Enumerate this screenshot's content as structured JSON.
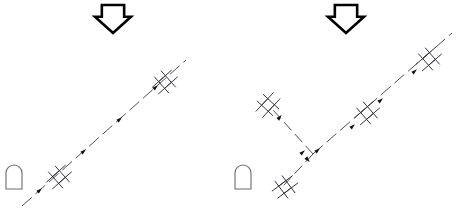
{
  "diagram": {
    "background_color": "#ffffff",
    "line_color": "#3c3c46",
    "tower_color": "#30303a",
    "arrow_color": "#000000",
    "building_color": "#6b6b73",
    "panels": [
      {
        "id": "left-panel",
        "name": "left-route-panel",
        "arrow": {
          "name": "down-arrow-left",
          "direction": "down",
          "x": 113,
          "y": 19,
          "width": 36,
          "height": 28
        },
        "building": {
          "name": "building-left",
          "shape": "arch",
          "x": 14,
          "y": 189,
          "width": 16,
          "height": 24
        },
        "routes": [
          {
            "name": "route-main-left",
            "dash": "13 5",
            "points": [
              [
                22,
                206
              ],
              [
                186,
                60
              ]
            ]
          }
        ],
        "towers": [
          {
            "name": "tower-left-lower",
            "x": 59,
            "y": 177,
            "angle": -41.7,
            "scale": 1.0
          },
          {
            "name": "tower-left-upper",
            "x": 165,
            "y": 82,
            "angle": -41.7,
            "scale": 1.0
          }
        ],
        "markers": [
          {
            "name": "flow-marker",
            "x": 40,
            "y": 190,
            "angle": -41.7
          },
          {
            "name": "flow-marker",
            "x": 84,
            "y": 151,
            "angle": -41.7
          },
          {
            "name": "flow-marker",
            "x": 120,
            "y": 119,
            "angle": -41.7
          },
          {
            "name": "flow-marker",
            "x": 156,
            "y": 87,
            "angle": -41.7
          }
        ]
      },
      {
        "id": "right-panel",
        "name": "right-route-panel",
        "arrow": {
          "name": "down-arrow-right",
          "direction": "down",
          "x": 346,
          "y": 19,
          "width": 36,
          "height": 28
        },
        "building": {
          "name": "building-right",
          "shape": "arch",
          "x": 243,
          "y": 189,
          "width": 16,
          "height": 24
        },
        "routes": [
          {
            "name": "route-main-right",
            "dash": "13 5",
            "points": [
              [
                313,
                154
              ],
              [
                452,
                33
              ]
            ]
          },
          {
            "name": "route-branch-upper-left",
            "dash": "11 5",
            "points": [
              [
                313,
                154
              ],
              [
                273,
                110
              ]
            ]
          },
          {
            "name": "route-branch-lower-left",
            "dash": "11 5",
            "points": [
              [
                313,
                154
              ],
              [
                283,
                186
              ]
            ]
          }
        ],
        "towers": [
          {
            "name": "tower-right-branch-upper",
            "x": 268,
            "y": 105,
            "angle": -47.0,
            "scale": 1.0
          },
          {
            "name": "tower-right-branch-lower",
            "x": 285,
            "y": 187,
            "angle": -37.0,
            "scale": 1.0
          },
          {
            "name": "tower-right-middle",
            "x": 367,
            "y": 113,
            "angle": -41.0,
            "scale": 1.0
          },
          {
            "name": "tower-right-upper",
            "x": 429,
            "y": 59,
            "angle": -41.0,
            "scale": 1.0
          }
        ],
        "markers": [
          {
            "name": "flow-marker",
            "x": 303,
            "y": 152,
            "angle": -41.0
          },
          {
            "name": "flow-marker",
            "x": 318,
            "y": 150,
            "angle": -41.0
          },
          {
            "name": "flow-marker",
            "x": 353,
            "y": 126,
            "angle": -41.0
          },
          {
            "name": "flow-marker",
            "x": 381,
            "y": 100,
            "angle": -41.0
          },
          {
            "name": "flow-marker",
            "x": 415,
            "y": 71,
            "angle": -41.0
          },
          {
            "name": "flow-marker",
            "x": 280,
            "y": 117,
            "angle": -47.0
          },
          {
            "name": "flow-marker",
            "x": 308,
            "y": 160,
            "angle": 47.0
          }
        ]
      }
    ],
    "tower_symbol": {
      "name": "transmission-tower-symbol",
      "description": "ladder glyph: two parallel rails along route with two crossarms",
      "rail_length": 26,
      "rail_offset": 4.5,
      "crossarm_length": 22,
      "crossarm_gap": 9
    }
  }
}
